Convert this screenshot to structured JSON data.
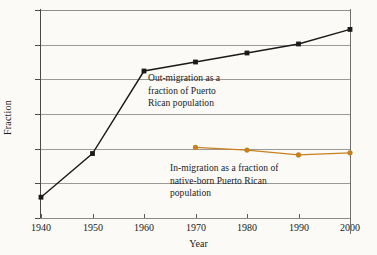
{
  "chart_data": {
    "type": "line",
    "title": "",
    "xlabel": "Year",
    "ylabel": "Fraction",
    "x": [
      1940,
      1950,
      1960,
      1970,
      1980,
      1990,
      2000
    ],
    "xlim": [
      1940,
      2000
    ],
    "ylim": [
      0,
      0.3
    ],
    "xticks": [
      "1940",
      "1950",
      "1960",
      "1970",
      "1980",
      "1990",
      "2000"
    ],
    "yticks": [
      "0",
      "0.05",
      "0.1",
      "0.15",
      "0.2",
      "0.25",
      "0.3"
    ],
    "ytick_values": [
      0,
      0.05,
      0.1,
      0.15,
      0.2,
      0.25,
      0.3
    ],
    "grid": true,
    "legend": "none",
    "series": [
      {
        "name": "Out-migration as a fraction of Puerto Rican population",
        "color": "#1a1a1a",
        "marker": "square",
        "x": [
          1940,
          1950,
          1960,
          1970,
          1980,
          1990,
          2000
        ],
        "values": [
          0.03,
          0.093,
          0.212,
          0.225,
          0.238,
          0.251,
          0.272
        ]
      },
      {
        "name": "In-migration as a fraction of native-born Puerto Rican population",
        "color": "#c8801e",
        "marker": "circle",
        "x": [
          1970,
          1980,
          1990,
          2000
        ],
        "values": [
          0.102,
          0.098,
          0.091,
          0.094
        ]
      }
    ],
    "annotations": [
      {
        "id": "out-migration",
        "text": "Out-migration as a\nfraction of Puerto\nRican population"
      },
      {
        "id": "in-migration",
        "text": "In-migration as a fraction of\nnative-born Puerto Rican\npopulation"
      }
    ]
  }
}
